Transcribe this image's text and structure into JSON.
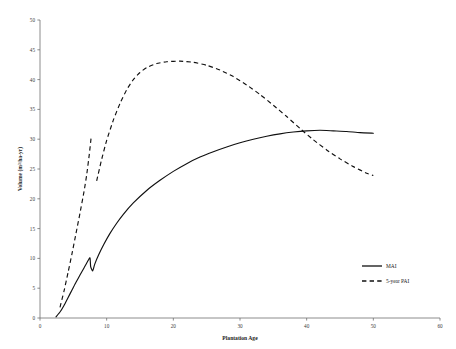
{
  "chart_data": {
    "type": "line",
    "title": "",
    "xlabel": "Plantation Age",
    "ylabel": "Volume (m³/ha-yr)",
    "xlim": [
      0,
      60
    ],
    "ylim": [
      0,
      50
    ],
    "xticks": [
      0,
      10,
      20,
      30,
      40,
      50,
      60
    ],
    "yticks": [
      0,
      5,
      10,
      15,
      20,
      25,
      30,
      35,
      40,
      45,
      50
    ],
    "xtick_labels": [
      "0",
      "10",
      "20",
      "30",
      "40",
      "50",
      "60"
    ],
    "ytick_labels": [
      "0",
      "5",
      "10",
      "15",
      "20",
      "25",
      "30",
      "35",
      "40",
      "45",
      "50"
    ],
    "grid": false,
    "legend_position": "lower-right",
    "series": [
      {
        "name": "MAI",
        "style": "solid",
        "color": "#101010",
        "points": [
          [
            2.4,
            0.2
          ],
          [
            3.0,
            1.0
          ],
          [
            3.6,
            2.1
          ],
          [
            4.2,
            3.4
          ],
          [
            4.8,
            4.7
          ],
          [
            5.4,
            6.0
          ],
          [
            6.0,
            7.2
          ],
          [
            6.6,
            8.4
          ],
          [
            7.1,
            9.4
          ],
          [
            7.5,
            10.1
          ],
          [
            7.6,
            8.6
          ],
          [
            7.9,
            7.9
          ],
          [
            8.2,
            9.0
          ],
          [
            8.8,
            10.6
          ],
          [
            9.6,
            12.4
          ],
          [
            10.5,
            14.2
          ],
          [
            11.5,
            15.9
          ],
          [
            12.5,
            17.4
          ],
          [
            14.0,
            19.3
          ],
          [
            16.0,
            21.4
          ],
          [
            18.0,
            23.1
          ],
          [
            20.0,
            24.6
          ],
          [
            22.0,
            25.9
          ],
          [
            24.0,
            27.0
          ],
          [
            26.0,
            27.9
          ],
          [
            28.0,
            28.7
          ],
          [
            30.0,
            29.4
          ],
          [
            32.0,
            30.0
          ],
          [
            34.0,
            30.5
          ],
          [
            36.0,
            30.9
          ],
          [
            38.0,
            31.2
          ],
          [
            40.0,
            31.4
          ],
          [
            42.0,
            31.5
          ],
          [
            44.0,
            31.4
          ],
          [
            46.0,
            31.3
          ],
          [
            48.0,
            31.1
          ],
          [
            50.0,
            31.0
          ]
        ]
      },
      {
        "name": "5-year PAI",
        "style": "dashed",
        "color": "#101010",
        "segments": [
          {
            "points": [
              [
                3.0,
                1.8
              ],
              [
                3.6,
                4.5
              ],
              [
                4.2,
                7.6
              ],
              [
                4.8,
                10.8
              ],
              [
                5.4,
                14.2
              ],
              [
                6.0,
                17.6
              ],
              [
                6.6,
                21.2
              ],
              [
                7.0,
                24.0
              ],
              [
                7.4,
                27.5
              ],
              [
                7.7,
                30.6
              ]
            ]
          },
          {
            "points": [
              [
                8.5,
                23.0
              ],
              [
                9.2,
                26.4
              ],
              [
                10.0,
                29.8
              ],
              [
                11.0,
                33.2
              ],
              [
                12.0,
                36.0
              ],
              [
                13.0,
                38.3
              ],
              [
                14.0,
                40.0
              ],
              [
                15.0,
                41.2
              ],
              [
                16.0,
                42.0
              ],
              [
                17.5,
                42.7
              ],
              [
                19.0,
                43.0
              ],
              [
                21.0,
                43.1
              ],
              [
                23.0,
                42.9
              ],
              [
                25.0,
                42.4
              ],
              [
                27.0,
                41.6
              ],
              [
                29.0,
                40.5
              ],
              [
                31.0,
                39.1
              ],
              [
                33.0,
                37.5
              ],
              [
                35.0,
                35.7
              ],
              [
                37.0,
                33.8
              ],
              [
                39.0,
                31.8
              ],
              [
                41.0,
                29.9
              ],
              [
                43.0,
                28.2
              ],
              [
                45.0,
                26.7
              ],
              [
                47.0,
                25.4
              ],
              [
                49.0,
                24.3
              ],
              [
                50.0,
                23.9
              ]
            ]
          }
        ]
      }
    ],
    "annotations": [
      "MAI shows a sharp dip near age 7.5-8",
      "5-year PAI curve is broken between age 7.7 and 8.5",
      "MAI and 5-year PAI cross near age 40"
    ]
  },
  "legend": {
    "entries": [
      {
        "label": "MAI"
      },
      {
        "label": "5-year PAI"
      }
    ]
  }
}
